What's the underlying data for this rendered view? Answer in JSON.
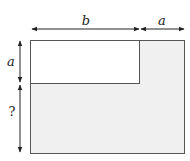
{
  "diagram": {
    "labels": {
      "top_left_width": "b",
      "top_right_width": "a",
      "left_top_height": "a",
      "left_bottom_height": "?"
    },
    "colors": {
      "outer_fill": "#f0f0f0",
      "inner_fill": "#ffffff",
      "stroke": "#555555",
      "arrow": "#222222"
    }
  }
}
